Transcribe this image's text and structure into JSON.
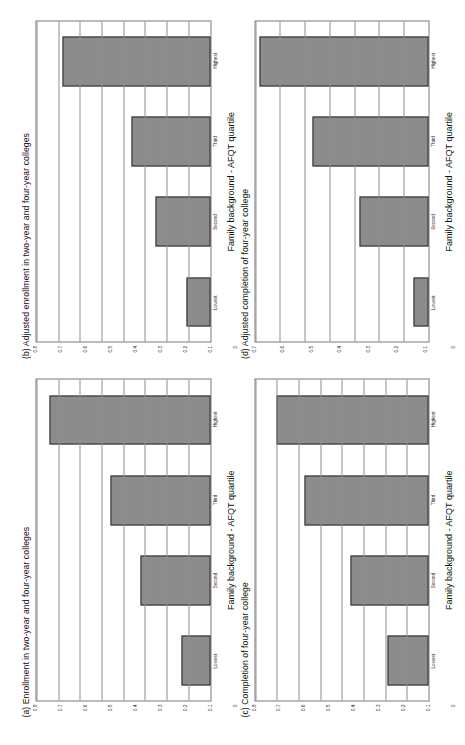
{
  "figure": {
    "orientation": "rotated-90-ccw",
    "background": "#ffffff",
    "bar_fill": "#8c8c8c",
    "bar_stroke": "#2b2b2b",
    "grid_color": "#8d8d8d"
  },
  "panels": [
    {
      "id": "panel-a",
      "title": "(a) Enrollment in two-year and four-year colleges",
      "xlabel": "Family background - AFQT quartile",
      "categories": [
        "Lowest",
        "Second",
        "Third",
        "Highest"
      ],
      "values": [
        0.13,
        0.32,
        0.46,
        0.74
      ],
      "yticks": [
        "0",
        "0.1",
        "0.2",
        "0.3",
        "0.4",
        "0.5",
        "0.6",
        "0.7",
        "0.8"
      ],
      "ylim": [
        0,
        0.8
      ]
    },
    {
      "id": "panel-b",
      "title": "(b) Adjusted enrollment in two-year and four-year colleges",
      "xlabel": "Family background - AFQT quartile",
      "categories": [
        "Lowest",
        "Second",
        "Third",
        "Highest"
      ],
      "values": [
        0.11,
        0.25,
        0.36,
        0.68
      ],
      "yticks": [
        "0",
        "0.1",
        "0.2",
        "0.3",
        "0.4",
        "0.5",
        "0.6",
        "0.7",
        "0.8"
      ],
      "ylim": [
        0,
        0.8
      ]
    },
    {
      "id": "panel-c",
      "title": "(c) Completion of four-year college",
      "xlabel": "Family background - AFQT quartile",
      "categories": [
        "Lowest",
        "Second",
        "Third",
        "Highest"
      ],
      "values": [
        0.19,
        0.36,
        0.57,
        0.7
      ],
      "yticks": [
        "0",
        "0.1",
        "0.2",
        "0.3",
        "0.4",
        "0.5",
        "0.6",
        "0.7",
        "0.8"
      ],
      "ylim": [
        0,
        0.8
      ]
    },
    {
      "id": "panel-d",
      "title": "(d) Adjusted completion of four-year college",
      "xlabel": "Family background - AFQT quartile",
      "categories": [
        "Lowest",
        "Second",
        "Third",
        "Highest"
      ],
      "values": [
        0.06,
        0.28,
        0.47,
        0.68
      ],
      "yticks": [
        "0",
        "0.1",
        "0.2",
        "0.3",
        "0.4",
        "0.5",
        "0.6",
        "0.7"
      ],
      "ylim": [
        0,
        0.7
      ]
    }
  ],
  "chart_data": [
    {
      "type": "bar",
      "title": "(a) Enrollment in two-year and four-year colleges",
      "xlabel": "Family background - AFQT quartile",
      "ylabel": "",
      "categories": [
        "Lowest",
        "Second",
        "Third",
        "Highest"
      ],
      "values": [
        0.13,
        0.32,
        0.46,
        0.74
      ],
      "ylim": [
        0,
        0.8
      ],
      "yticks": [
        0,
        0.1,
        0.2,
        0.3,
        0.4,
        0.5,
        0.6,
        0.7,
        0.8
      ],
      "grid": true,
      "legend": false,
      "orientation": "vertical"
    },
    {
      "type": "bar",
      "title": "(b) Adjusted enrollment in two-year and four-year colleges",
      "xlabel": "Family background - AFQT quartile",
      "ylabel": "",
      "categories": [
        "Lowest",
        "Second",
        "Third",
        "Highest"
      ],
      "values": [
        0.11,
        0.25,
        0.36,
        0.68
      ],
      "ylim": [
        0,
        0.8
      ],
      "yticks": [
        0,
        0.1,
        0.2,
        0.3,
        0.4,
        0.5,
        0.6,
        0.7,
        0.8
      ],
      "grid": true,
      "legend": false,
      "orientation": "vertical"
    },
    {
      "type": "bar",
      "title": "(c) Completion of four-year college",
      "xlabel": "Family background - AFQT quartile",
      "ylabel": "",
      "categories": [
        "Lowest",
        "Second",
        "Third",
        "Highest"
      ],
      "values": [
        0.19,
        0.36,
        0.57,
        0.7
      ],
      "ylim": [
        0,
        0.8
      ],
      "yticks": [
        0,
        0.1,
        0.2,
        0.3,
        0.4,
        0.5,
        0.6,
        0.7,
        0.8
      ],
      "grid": true,
      "legend": false,
      "orientation": "vertical"
    },
    {
      "type": "bar",
      "title": "(d) Adjusted completion of four-year college",
      "xlabel": "Family background - AFQT quartile",
      "ylabel": "",
      "categories": [
        "Lowest",
        "Second",
        "Third",
        "Highest"
      ],
      "values": [
        0.06,
        0.28,
        0.47,
        0.68
      ],
      "ylim": [
        0,
        0.7
      ],
      "yticks": [
        0,
        0.1,
        0.2,
        0.3,
        0.4,
        0.5,
        0.6,
        0.7
      ],
      "grid": true,
      "legend": false,
      "orientation": "vertical"
    }
  ]
}
